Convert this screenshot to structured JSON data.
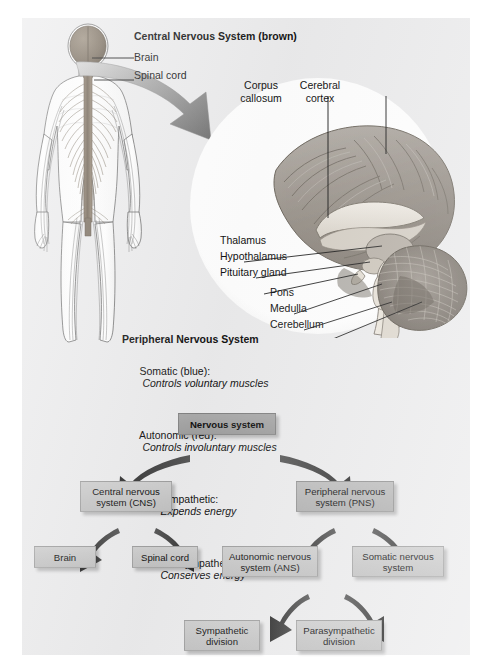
{
  "figure": {
    "background_color": "#ececed",
    "page_color": "#ffffff"
  },
  "cns_legend": {
    "title": "Central Nervous System (brown)",
    "items": [
      {
        "label": "Brain"
      },
      {
        "label": "Spinal cord"
      }
    ]
  },
  "pns_legend": {
    "title": "Peripheral Nervous System",
    "items": [
      {
        "label": "Somatic (blue):",
        "desc": "Controls voluntary muscles",
        "indent": 0
      },
      {
        "label": "Autonomic (red):",
        "desc": "Controls involuntary muscles",
        "indent": 0
      },
      {
        "label": "Sympathetic:",
        "desc": "Expends energy",
        "indent": 1
      },
      {
        "label": "Parasympathetic:",
        "desc": "Conserves energy",
        "indent": 1
      }
    ]
  },
  "brain_inset": {
    "labels": {
      "corpus_callosum_l1": "Corpus",
      "corpus_callosum_l2": "callosum",
      "cerebral_cortex_l1": "Cerebral",
      "cerebral_cortex_l2": "cortex",
      "thalamus": "Thalamus",
      "hypothalamus": "Hypothalamus",
      "pituitary": "Pituitary gland",
      "pons": "Pons",
      "medulla": "Medulla",
      "cerebellum": "Cerebellum"
    }
  },
  "flowchart": {
    "tier1": [
      {
        "id": "nervous-system",
        "line1": "Nervous system",
        "line2": "",
        "style": "dark"
      }
    ],
    "tier2": [
      {
        "id": "cns",
        "line1": "Central nervous",
        "line2": "system (CNS)",
        "style": "light"
      },
      {
        "id": "pns",
        "line1": "Peripheral nervous",
        "line2": "system (PNS)",
        "style": "mid"
      }
    ],
    "tier3": [
      {
        "id": "brain",
        "line1": "Brain",
        "line2": "",
        "style": "light"
      },
      {
        "id": "spinal-cord",
        "line1": "Spinal cord",
        "line2": "",
        "style": "light"
      },
      {
        "id": "ans",
        "line1": "Autonomic nervous",
        "line2": "system (ANS)",
        "style": "light"
      },
      {
        "id": "somatic",
        "line1": "Somatic nervous",
        "line2": "system",
        "style": "light"
      }
    ],
    "tier4": [
      {
        "id": "sympathetic",
        "line1": "Sympathetic",
        "line2": "division",
        "style": "light"
      },
      {
        "id": "parasympathetic",
        "line1": "Parasympathetic",
        "line2": "division",
        "style": "light"
      }
    ]
  }
}
